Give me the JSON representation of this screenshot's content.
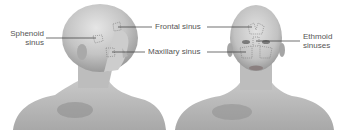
{
  "figure": {
    "type": "anatomical-illustration",
    "views": [
      "side-view-head",
      "front-view-head"
    ]
  },
  "labels": {
    "sphenoid": [
      "Sphenoid",
      "sinus"
    ],
    "frontal": "Frontal sinus",
    "maxillary": "Maxillary sinus",
    "ethmoid": [
      "Ethmoid",
      "sinuses"
    ]
  },
  "colors": {
    "skin_light": "#d6d6d6",
    "skin_mid": "#b8b8b8",
    "skin_dark": "#8a8a8a",
    "leader_line": "#333333",
    "label_text": "#555555",
    "sinus_outline": "#777777"
  }
}
